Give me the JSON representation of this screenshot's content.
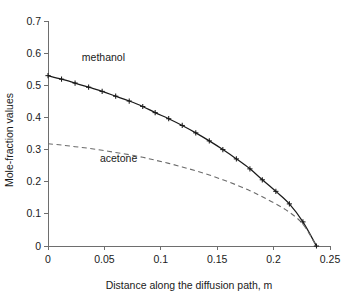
{
  "chart_data": {
    "type": "line",
    "title": "",
    "subtitle": "",
    "xlabel": "Distance along the diffusion path, m",
    "ylabel": "Mole-fraction values",
    "xlim": [
      0,
      0.25
    ],
    "ylim": [
      0,
      0.7
    ],
    "xticks": [
      0,
      0.05,
      0.1,
      0.15,
      0.2,
      0.25
    ],
    "xtick_labels": [
      "0",
      "0.05",
      "0.1",
      "0.15",
      "0.2",
      "0.25"
    ],
    "yticks": [
      0,
      0.1,
      0.2,
      0.3,
      0.4,
      0.5,
      0.6,
      0.7
    ],
    "ytick_labels": [
      "0",
      "0.1",
      "0.2",
      "0.3",
      "0.4",
      "0.5",
      "0.6",
      "0.7"
    ],
    "grid": false,
    "legend_position": "inline-annotation",
    "series": [
      {
        "name": "methanol",
        "style": "solid",
        "color": "#1a1a1a",
        "marker": "plus",
        "x": [
          0.0,
          0.012,
          0.024,
          0.036,
          0.048,
          0.06,
          0.072,
          0.084,
          0.095,
          0.107,
          0.119,
          0.131,
          0.143,
          0.155,
          0.167,
          0.179,
          0.19,
          0.202,
          0.214,
          0.226,
          0.238
        ],
        "values": [
          0.53,
          0.519,
          0.507,
          0.494,
          0.481,
          0.466,
          0.451,
          0.434,
          0.415,
          0.396,
          0.375,
          0.352,
          0.327,
          0.3,
          0.271,
          0.24,
          0.206,
          0.17,
          0.131,
          0.075,
          0.0
        ]
      },
      {
        "name": "acetone",
        "style": "dashed",
        "color": "#6b6b6b",
        "marker": "none",
        "x": [
          0.0,
          0.012,
          0.024,
          0.036,
          0.048,
          0.06,
          0.072,
          0.084,
          0.095,
          0.107,
          0.119,
          0.131,
          0.143,
          0.155,
          0.167,
          0.179,
          0.19,
          0.202,
          0.214,
          0.226,
          0.238
        ],
        "values": [
          0.318,
          0.314,
          0.309,
          0.304,
          0.298,
          0.291,
          0.284,
          0.276,
          0.267,
          0.257,
          0.246,
          0.234,
          0.221,
          0.206,
          0.19,
          0.172,
          0.153,
          0.131,
          0.105,
          0.068,
          0.0
        ]
      }
    ],
    "annotations": [
      {
        "text": "methanol",
        "x": 0.03,
        "y": 0.575
      },
      {
        "text": "acetone",
        "x": 0.046,
        "y": 0.262
      }
    ]
  }
}
